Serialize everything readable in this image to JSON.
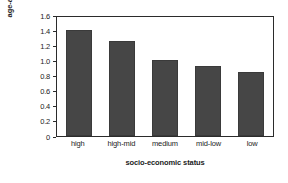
{
  "chart_data": {
    "type": "bar",
    "title": "",
    "categories": [
      "high",
      "high-mid",
      "medium",
      "mid-low",
      "low"
    ],
    "values": [
      1.4,
      1.25,
      1.0,
      0.93,
      0.85
    ],
    "xlabel": "socio-economic status",
    "ylabel_line1": "age-adjusted incidence",
    "ylabel_line2": "(per 100,000)",
    "ylim": [
      0,
      1.6
    ],
    "yticks": [
      "1.6",
      "1.4",
      "1.2",
      "1.0",
      "0.8",
      "0.6",
      "0.4",
      "0.2",
      "0"
    ],
    "ytick_values": [
      1.6,
      1.4,
      1.2,
      1.0,
      0.8,
      0.6,
      0.4,
      0.2,
      0
    ],
    "grid": false,
    "legend": null,
    "bar_color": "#464646",
    "axis_color": "#2b2b2b",
    "text_color": "#1c1c1c",
    "background": "#ffffff"
  }
}
